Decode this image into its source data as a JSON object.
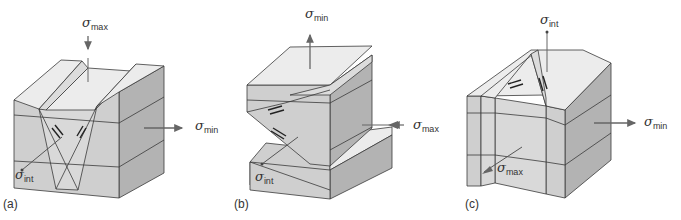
{
  "figure": {
    "panels": [
      {
        "label": "(a)",
        "fault_type": "normal (conjugate)",
        "stresses": {
          "vertical": {
            "symbol": "σ",
            "sub": "max"
          },
          "horizontal": {
            "symbol": "σ",
            "sub": "min"
          },
          "oblique": {
            "symbol": "σ",
            "sub": "int"
          }
        }
      },
      {
        "label": "(b)",
        "fault_type": "thrust",
        "stresses": {
          "vertical": {
            "symbol": "σ",
            "sub": "min"
          },
          "horizontal": {
            "symbol": "σ",
            "sub": "max"
          },
          "oblique": {
            "symbol": "σ",
            "sub": "int"
          }
        }
      },
      {
        "label": "(c)",
        "fault_type": "strike-slip",
        "stresses": {
          "vertical": {
            "symbol": "σ",
            "sub": "int"
          },
          "horizontal": {
            "symbol": "σ",
            "sub": "min"
          },
          "oblique": {
            "symbol": "σ",
            "sub": "max"
          }
        }
      }
    ],
    "colors": {
      "top": "#ececec",
      "front": "#cfcfcf",
      "side": "#b3b3b3",
      "edge": "#3a3a3a",
      "arrow": "#666666"
    }
  }
}
